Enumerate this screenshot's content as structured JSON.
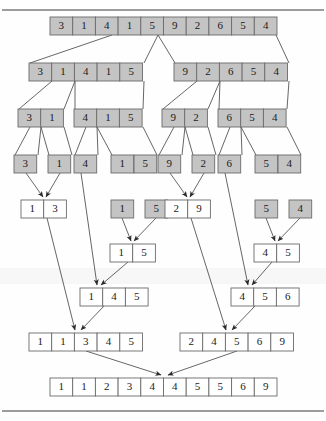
{
  "figure": {
    "kind": "merge-sort-recursion-diagram",
    "width": 326,
    "height": 421,
    "colors": {
      "gray_fill": "#c4c4c4",
      "white_fill": "#ffffff",
      "cell_border": "#6b6b6b",
      "line": "#555555",
      "rule": "#3a3a3a",
      "text": "#1a1a1a"
    },
    "top_rule_label": "",
    "bottom_rule_label": ""
  },
  "levels": [
    {
      "name": "level-0-unsorted-root",
      "y": 17,
      "fill": "gray",
      "arrays": [
        {
          "name": "root",
          "x": 50,
          "values": [
            "3",
            "1",
            "4",
            "1",
            "5",
            "9",
            "2",
            "6",
            "5",
            "4"
          ]
        }
      ]
    },
    {
      "name": "level-1-split-halves",
      "y": 63,
      "fill": "gray",
      "arrays": [
        {
          "name": "left-half",
          "x": 29,
          "values": [
            "3",
            "1",
            "4",
            "1",
            "5"
          ]
        },
        {
          "name": "right-half",
          "x": 174,
          "values": [
            "9",
            "2",
            "6",
            "5",
            "4"
          ]
        }
      ]
    },
    {
      "name": "level-2-split-quarters",
      "y": 109,
      "fill": "gray",
      "arrays": [
        {
          "name": "q1",
          "x": 18,
          "values": [
            "3",
            "1"
          ]
        },
        {
          "name": "q2",
          "x": 74,
          "values": [
            "4",
            "1",
            "5"
          ]
        },
        {
          "name": "q3",
          "x": 162,
          "values": [
            "9",
            "2"
          ]
        },
        {
          "name": "q4",
          "x": 218,
          "values": [
            "6",
            "5",
            "4"
          ]
        }
      ]
    },
    {
      "name": "level-3-split-singletons",
      "y": 155,
      "fill": "gray",
      "arrays": [
        {
          "name": "s1",
          "x": 14,
          "values": [
            "3"
          ]
        },
        {
          "name": "s2",
          "x": 48,
          "values": [
            "1"
          ]
        },
        {
          "name": "s3",
          "x": 74,
          "values": [
            "4"
          ]
        },
        {
          "name": "s4",
          "x": 111,
          "values": [
            "1"
          ]
        },
        {
          "name": "s5",
          "x": 134,
          "values": [
            "5"
          ]
        },
        {
          "name": "s6",
          "x": 158,
          "values": [
            "9"
          ]
        },
        {
          "name": "s7",
          "x": 192,
          "values": [
            "2"
          ]
        },
        {
          "name": "s8",
          "x": 218,
          "values": [
            "6"
          ]
        },
        {
          "name": "s9",
          "x": 255,
          "values": [
            "5"
          ]
        },
        {
          "name": "s10",
          "x": 278,
          "values": [
            "4"
          ]
        }
      ]
    },
    {
      "name": "level-4-first-merges",
      "y": 200,
      "arrays": [
        {
          "name": "merged-1-3",
          "x": 21,
          "fill": "white",
          "values": [
            "1",
            "3"
          ]
        },
        {
          "name": "single-1",
          "x": 111,
          "fill": "gray",
          "values": [
            "1"
          ]
        },
        {
          "name": "single-5",
          "x": 145,
          "fill": "gray",
          "values": [
            "5"
          ]
        },
        {
          "name": "merged-2-9",
          "x": 165,
          "fill": "white",
          "values": [
            "2",
            "9"
          ]
        },
        {
          "name": "single-5b",
          "x": 255,
          "fill": "gray",
          "values": [
            "5"
          ]
        },
        {
          "name": "single-4b",
          "x": 289,
          "fill": "gray",
          "values": [
            "4"
          ]
        }
      ]
    },
    {
      "name": "level-5-second-merges",
      "y": 244,
      "fill": "white",
      "arrays": [
        {
          "name": "merged-1-5",
          "x": 110,
          "values": [
            "1",
            "5"
          ]
        },
        {
          "name": "merged-4-5",
          "x": 254,
          "values": [
            "4",
            "5"
          ]
        }
      ]
    },
    {
      "name": "level-6-triple-merges",
      "y": 288,
      "fill": "white",
      "arrays": [
        {
          "name": "merged-1-4-5",
          "x": 80,
          "values": [
            "1",
            "4",
            "5"
          ]
        },
        {
          "name": "merged-4-5-6",
          "x": 231,
          "values": [
            "4",
            "5",
            "6"
          ]
        }
      ]
    },
    {
      "name": "level-7-half-merges",
      "y": 333,
      "fill": "white",
      "arrays": [
        {
          "name": "merged-left-half",
          "x": 29,
          "values": [
            "1",
            "1",
            "3",
            "4",
            "5"
          ]
        },
        {
          "name": "merged-right-half",
          "x": 180,
          "values": [
            "2",
            "4",
            "5",
            "6",
            "9"
          ]
        }
      ]
    },
    {
      "name": "level-8-final-sorted",
      "y": 378,
      "fill": "white",
      "arrays": [
        {
          "name": "final-sorted",
          "x": 50,
          "values": [
            "1",
            "1",
            "2",
            "3",
            "4",
            "4",
            "5",
            "5",
            "6",
            "9"
          ]
        }
      ]
    }
  ],
  "split_lines": [
    {
      "name": "split-root-to-left",
      "x1": 112,
      "y1": 35,
      "x2": 30,
      "y2": 63
    },
    {
      "name": "split-root-to-left-end",
      "x1": 158,
      "y1": 35,
      "x2": 144,
      "y2": 63
    },
    {
      "name": "split-root-to-right",
      "x1": 158,
      "y1": 35,
      "x2": 175,
      "y2": 63
    },
    {
      "name": "split-root-to-right-end",
      "x1": 276,
      "y1": 35,
      "x2": 289,
      "y2": 63
    },
    {
      "name": "split-lh-to-q1",
      "x1": 52,
      "y1": 81,
      "x2": 19,
      "y2": 109
    },
    {
      "name": "split-lh-to-q1-end",
      "x1": 75,
      "y1": 81,
      "x2": 64,
      "y2": 109
    },
    {
      "name": "split-lh-to-q2",
      "x1": 75,
      "y1": 81,
      "x2": 75,
      "y2": 109
    },
    {
      "name": "split-lh-to-q2-end",
      "x1": 144,
      "y1": 81,
      "x2": 143,
      "y2": 109
    },
    {
      "name": "split-rh-to-q3",
      "x1": 197,
      "y1": 81,
      "x2": 163,
      "y2": 109
    },
    {
      "name": "split-rh-to-q3-end",
      "x1": 220,
      "y1": 81,
      "x2": 208,
      "y2": 109
    },
    {
      "name": "split-rh-to-q4",
      "x1": 220,
      "y1": 81,
      "x2": 219,
      "y2": 109
    },
    {
      "name": "split-rh-to-q4-end",
      "x1": 289,
      "y1": 81,
      "x2": 287,
      "y2": 109
    },
    {
      "name": "split-q1-to-s1",
      "x1": 30,
      "y1": 127,
      "x2": 15,
      "y2": 155
    },
    {
      "name": "split-q1-to-s1-end",
      "x1": 41,
      "y1": 127,
      "x2": 38,
      "y2": 155
    },
    {
      "name": "split-q1-to-s2",
      "x1": 41,
      "y1": 127,
      "x2": 49,
      "y2": 155
    },
    {
      "name": "split-q1-to-s2-end",
      "x1": 64,
      "y1": 127,
      "x2": 72,
      "y2": 155
    },
    {
      "name": "split-q2-to-s3",
      "x1": 86,
      "y1": 127,
      "x2": 75,
      "y2": 155
    },
    {
      "name": "split-q2-to-s3-end",
      "x1": 97,
      "y1": 127,
      "x2": 98,
      "y2": 155
    },
    {
      "name": "split-q2-to-s45",
      "x1": 97,
      "y1": 127,
      "x2": 112,
      "y2": 155
    },
    {
      "name": "split-q2-to-s45-end",
      "x1": 143,
      "y1": 127,
      "x2": 157,
      "y2": 155
    },
    {
      "name": "split-q3-to-s6",
      "x1": 174,
      "y1": 127,
      "x2": 159,
      "y2": 155
    },
    {
      "name": "split-q3-to-s6-end",
      "x1": 185,
      "y1": 127,
      "x2": 182,
      "y2": 155
    },
    {
      "name": "split-q3-to-s7",
      "x1": 185,
      "y1": 127,
      "x2": 193,
      "y2": 155
    },
    {
      "name": "split-q3-to-s7-end",
      "x1": 208,
      "y1": 127,
      "x2": 216,
      "y2": 155
    },
    {
      "name": "split-q4-to-s8",
      "x1": 230,
      "y1": 127,
      "x2": 219,
      "y2": 155
    },
    {
      "name": "split-q4-to-s8-end",
      "x1": 241,
      "y1": 127,
      "x2": 242,
      "y2": 155
    },
    {
      "name": "split-q4-to-s910",
      "x1": 241,
      "y1": 127,
      "x2": 256,
      "y2": 155
    },
    {
      "name": "split-q4-to-s910-end",
      "x1": 287,
      "y1": 127,
      "x2": 301,
      "y2": 155
    }
  ],
  "merge_arrows": [
    {
      "name": "arrow-s1-to-merged13",
      "x1": 26,
      "y1": 173,
      "x2": 43,
      "y2": 197
    },
    {
      "name": "arrow-s2-to-merged13",
      "x1": 60,
      "y1": 173,
      "x2": 46,
      "y2": 197
    },
    {
      "name": "arrow-s6-to-merged29",
      "x1": 170,
      "y1": 173,
      "x2": 187,
      "y2": 197
    },
    {
      "name": "arrow-s7-to-merged29",
      "x1": 204,
      "y1": 173,
      "x2": 190,
      "y2": 197
    },
    {
      "name": "arrow-1-to-merged15",
      "x1": 122,
      "y1": 218,
      "x2": 131,
      "y2": 241
    },
    {
      "name": "arrow-5-to-merged15",
      "x1": 156,
      "y1": 218,
      "x2": 134,
      "y2": 241
    },
    {
      "name": "arrow-5b-to-merged45",
      "x1": 266,
      "y1": 218,
      "x2": 275,
      "y2": 241
    },
    {
      "name": "arrow-4b-to-merged45",
      "x1": 300,
      "y1": 218,
      "x2": 278,
      "y2": 241
    },
    {
      "name": "arrow-s3-to-merged145",
      "x1": 81,
      "y1": 173,
      "x2": 97,
      "y2": 285
    },
    {
      "name": "arrow-merged15-to-merged145",
      "x1": 128,
      "y1": 262,
      "x2": 101,
      "y2": 285
    },
    {
      "name": "arrow-s8-to-merged456",
      "x1": 225,
      "y1": 173,
      "x2": 248,
      "y2": 285
    },
    {
      "name": "arrow-merged45-to-merged456",
      "x1": 272,
      "y1": 262,
      "x2": 252,
      "y2": 285
    },
    {
      "name": "arrow-merged13-to-lefthalf",
      "x1": 47,
      "y1": 218,
      "x2": 75,
      "y2": 330
    },
    {
      "name": "arrow-merged145-to-lefthalf",
      "x1": 104,
      "y1": 306,
      "x2": 81,
      "y2": 330
    },
    {
      "name": "arrow-merged29-to-righthalf",
      "x1": 191,
      "y1": 218,
      "x2": 226,
      "y2": 330
    },
    {
      "name": "arrow-merged456-to-righthalf",
      "x1": 255,
      "y1": 306,
      "x2": 232,
      "y2": 330
    },
    {
      "name": "arrow-lefthalf-to-final",
      "x1": 86,
      "y1": 351,
      "x2": 161,
      "y2": 375
    },
    {
      "name": "arrow-righthalf-to-final",
      "x1": 237,
      "y1": 351,
      "x2": 168,
      "y2": 375
    }
  ],
  "rules": [
    {
      "name": "top-rule",
      "y": 10
    },
    {
      "name": "bottom-rule",
      "y": 411
    }
  ]
}
